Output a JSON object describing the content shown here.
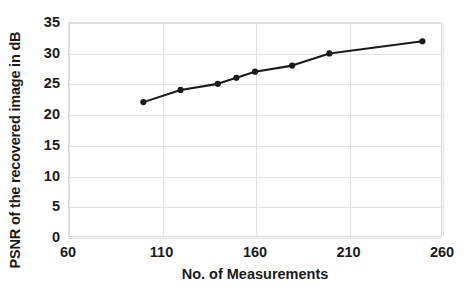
{
  "chart_data": {
    "type": "line",
    "title": "",
    "xlabel": "No. of Measurements",
    "ylabel": "PSNR of the recovered image in dB",
    "xlim": [
      60,
      260
    ],
    "ylim": [
      0,
      35
    ],
    "xticks": [
      60,
      110,
      160,
      210,
      260
    ],
    "yticks": [
      0,
      5,
      10,
      15,
      20,
      25,
      30,
      35
    ],
    "xtick_labels": [
      "60",
      "110",
      "160",
      "210",
      "260"
    ],
    "ytick_labels": [
      "0",
      "5",
      "10",
      "15",
      "20",
      "25",
      "30",
      "35"
    ],
    "grid": true,
    "legend": "none",
    "marker": "filled-diamond",
    "line_color": "#1a1a1a",
    "marker_color": "#1a1a1a",
    "grid_color": "#e2e2e2",
    "background": "#ffffff",
    "x": [
      100,
      120,
      140,
      150,
      160,
      180,
      200,
      250
    ],
    "values": [
      22,
      24,
      25,
      26,
      27,
      28,
      30,
      32
    ],
    "series": [
      {
        "name": "PSNR",
        "points": [
          {
            "x": 100,
            "y": 22
          },
          {
            "x": 120,
            "y": 24
          },
          {
            "x": 140,
            "y": 25
          },
          {
            "x": 150,
            "y": 26
          },
          {
            "x": 160,
            "y": 27
          },
          {
            "x": 180,
            "y": 28
          },
          {
            "x": 200,
            "y": 30
          },
          {
            "x": 250,
            "y": 32
          }
        ]
      }
    ]
  }
}
